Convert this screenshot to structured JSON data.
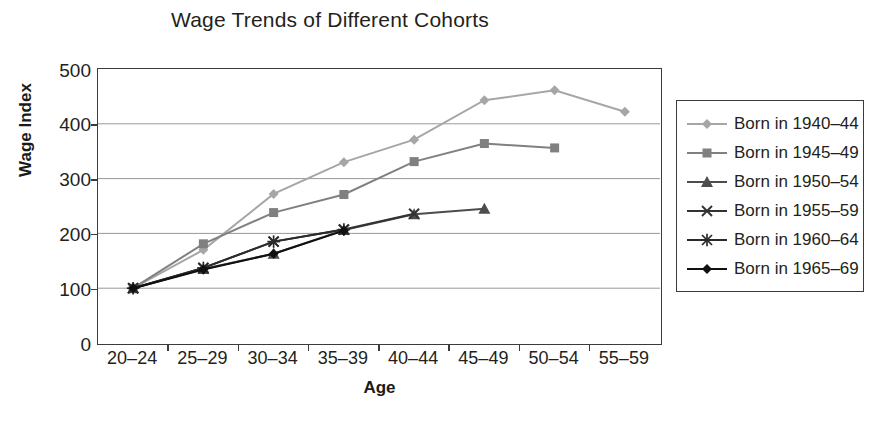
{
  "chart_data": {
    "type": "line",
    "title": "Wage Trends of Different Cohorts",
    "xlabel": "Age",
    "ylabel": "Wage Index",
    "categories": [
      "20–24",
      "25–29",
      "30–34",
      "35–39",
      "40–44",
      "45–49",
      "50–54",
      "55–59"
    ],
    "ylim": [
      0,
      500
    ],
    "yticks": [
      0,
      100,
      200,
      300,
      400,
      500
    ],
    "grid": "horizontal",
    "legend_position": "right",
    "series": [
      {
        "name": "Born in 1940–44",
        "marker": "diamond",
        "color": "#a6a6a6",
        "values": [
          100,
          170,
          272,
          330,
          371,
          443,
          461,
          422
        ]
      },
      {
        "name": "Born in 1945–49",
        "marker": "square",
        "color": "#808080",
        "values": [
          100,
          181,
          238,
          271,
          331,
          364,
          356,
          null
        ]
      },
      {
        "name": "Born in 1950–54",
        "marker": "triangle",
        "color": "#4d4d4d",
        "values": [
          100,
          135,
          163,
          206,
          235,
          245,
          null,
          null
        ]
      },
      {
        "name": "Born in 1955–59",
        "marker": "cross",
        "color": "#333333",
        "values": [
          100,
          137,
          185,
          207,
          236,
          null,
          null,
          null
        ]
      },
      {
        "name": "Born in 1960–64",
        "marker": "asterisk",
        "color": "#2b2b2b",
        "values": [
          100,
          137,
          185,
          207,
          null,
          null,
          null,
          null
        ]
      },
      {
        "name": "Born in 1965–69",
        "marker": "filled-diamond",
        "color": "#111111",
        "values": [
          100,
          134,
          163,
          205,
          null,
          null,
          null,
          null
        ]
      }
    ]
  }
}
